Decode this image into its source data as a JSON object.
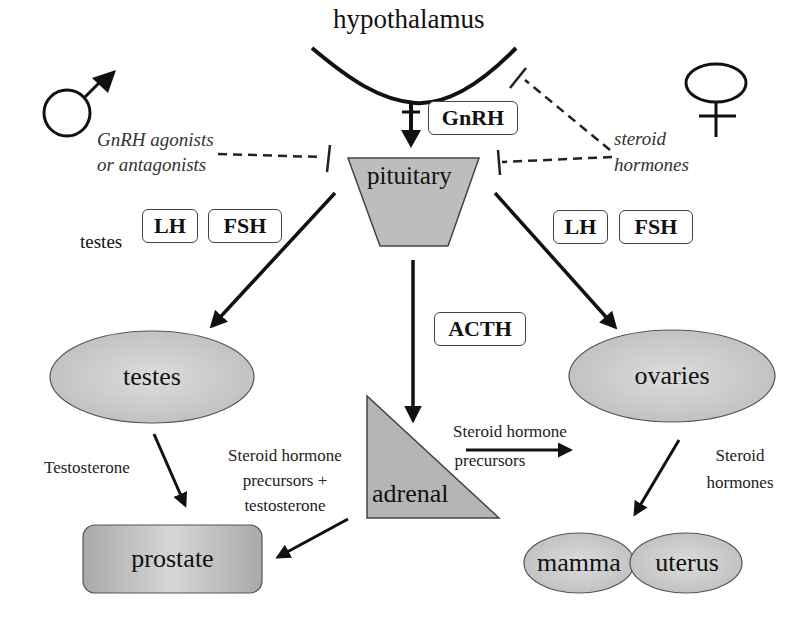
{
  "diagram": {
    "title_node": "hypothalamus",
    "symbols": {
      "male": "male-symbol",
      "female": "female-symbol"
    },
    "hormone_boxes": {
      "gnrh": "GnRH",
      "lh_left": "LH",
      "fsh_left": "FSH",
      "lh_right": "LH",
      "fsh_right": "FSH",
      "acth": "ACTH"
    },
    "organs": {
      "pituitary": "pituitary",
      "testes": "testes",
      "ovaries": "ovaries",
      "adrenal": "adrenal",
      "prostate": "prostate",
      "mamma": "mamma",
      "uterus": "uterus"
    },
    "annotations": {
      "gnrh_agonists_line1": "GnRH agonists",
      "gnrh_agonists_line2": "or antagonists",
      "steroid_hormones_line1": "steroid",
      "steroid_hormones_line2": "hormones",
      "testes_label": "testes",
      "testosterone": "Testosterone",
      "precursors_testosterone_line1": "Steroid hormone",
      "precursors_testosterone_line2": "precursors +",
      "precursors_testosterone_line3": "testosterone",
      "adrenal_precursors_line1": "Steroid hormone",
      "adrenal_precursors_line2": "precursors",
      "ovary_steroids_line1": "Steroid",
      "ovary_steroids_line2": "hormones"
    },
    "edges": [
      {
        "from": "hypothalamus",
        "to": "pituitary",
        "label": "GnRH",
        "type": "stimulate"
      },
      {
        "from": "GnRH agonists or antagonists",
        "to": "pituitary",
        "type": "inhibit"
      },
      {
        "from": "steroid hormones",
        "to": "pituitary",
        "type": "inhibit"
      },
      {
        "from": "steroid hormones",
        "to": "hypothalamus",
        "type": "inhibit"
      },
      {
        "from": "pituitary",
        "to": "testes",
        "label": "LH, FSH",
        "type": "stimulate"
      },
      {
        "from": "pituitary",
        "to": "ovaries",
        "label": "LH, FSH",
        "type": "stimulate"
      },
      {
        "from": "pituitary",
        "to": "adrenal",
        "label": "ACTH",
        "type": "stimulate"
      },
      {
        "from": "testes",
        "to": "prostate",
        "label": "Testosterone",
        "type": "stimulate"
      },
      {
        "from": "adrenal",
        "to": "prostate",
        "label": "Steroid hormone precursors + testosterone",
        "type": "stimulate"
      },
      {
        "from": "adrenal",
        "to": "right",
        "label": "Steroid hormone precursors",
        "type": "stimulate"
      },
      {
        "from": "ovaries",
        "to": "mamma/uterus",
        "label": "Steroid hormones",
        "type": "stimulate"
      }
    ],
    "colors": {
      "organ_fill": "#c8c8c8",
      "stroke": "#111111",
      "dashed": "#222222"
    }
  }
}
